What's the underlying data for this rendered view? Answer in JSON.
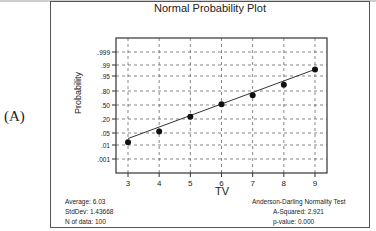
{
  "panel_label": "(A)",
  "chart_data": {
    "type": "scatter",
    "title": "Normal Probability Plot",
    "xlabel": "TV",
    "ylabel": "Probability",
    "x_ticks": [
      "3",
      "4",
      "5",
      "6",
      "7",
      "8",
      "9"
    ],
    "y_ticks": [
      ".999",
      ".99",
      ".95",
      ".80",
      ".50",
      ".20",
      ".05",
      ".01",
      ".001"
    ],
    "y_scale": "normal-probability",
    "xlim": [
      2.6,
      9.4
    ],
    "grid": true,
    "grid_style": "dashed",
    "series": [
      {
        "name": "TV data",
        "marker": "filled-circle",
        "x": [
          3,
          4,
          5,
          6,
          7,
          8,
          9
        ],
        "y": [
          0.015,
          0.06,
          0.24,
          0.52,
          0.72,
          0.88,
          0.98
        ]
      },
      {
        "name": "Fitted normal line",
        "style": "solid-line",
        "x": [
          3,
          9
        ],
        "y": [
          0.025,
          0.98
        ]
      }
    ],
    "annotations": {
      "left": [
        {
          "label": "Average:",
          "value": "6.03"
        },
        {
          "label": "StdDev:",
          "value": "1.43668"
        },
        {
          "label": "N of data:",
          "value": "100"
        }
      ],
      "right": {
        "heading": "Anderson-Darling Normality Test",
        "rows": [
          {
            "label": "A-Squared:",
            "value": "2.921"
          },
          {
            "label": "p-value:",
            "value": "0.000"
          }
        ]
      }
    }
  },
  "stats_text": {
    "average": "Average: 6.03",
    "stddev": "StdDev: 1.43668",
    "n": "N of data: 100",
    "ad_heading": "Anderson-Darling Normality Test",
    "a_squared": "A-Squared: 2.921",
    "p_value": "p-value:   0.000"
  }
}
